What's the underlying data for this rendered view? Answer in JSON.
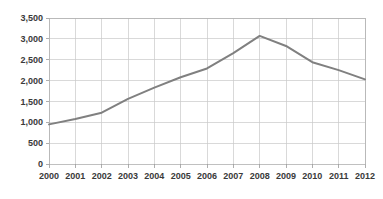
{
  "chart_data": {
    "type": "line",
    "title": "",
    "subtitle": "",
    "xlabel": "",
    "ylabel": "",
    "categories": [
      "2000",
      "2001",
      "2002",
      "2003",
      "2004",
      "2005",
      "2006",
      "2007",
      "2008",
      "2009",
      "2010",
      "2011",
      "2012"
    ],
    "values": [
      950,
      1080,
      1230,
      1560,
      1830,
      2080,
      2290,
      2660,
      3070,
      2830,
      2440,
      2250,
      2030
    ],
    "series": [
      {
        "name": "",
        "color": "#808080",
        "values": [
          950,
          1080,
          1230,
          1560,
          1830,
          2080,
          2290,
          2660,
          3070,
          2830,
          2440,
          2250,
          2030
        ]
      }
    ],
    "ylim": [
      0,
      3500
    ],
    "ytick_values": [
      0,
      500,
      1000,
      1500,
      2000,
      2500,
      3000,
      3500
    ],
    "ytick_labels": [
      "0",
      "500",
      "1,000",
      "1,500",
      "2,000",
      "2,500",
      "3,000",
      "3,500"
    ],
    "xtick_labels": [
      "2000",
      "2001",
      "2002",
      "2003",
      "2004",
      "2005",
      "2006",
      "2007",
      "2008",
      "2009",
      "2010",
      "2011",
      "2012"
    ],
    "grid": {
      "horizontal": true,
      "vertical": true,
      "color": "#c9c9c9"
    },
    "legend": {
      "visible": false,
      "position": "none",
      "entries": []
    },
    "markers": false,
    "background_color": "#ffffff",
    "line_color": "#808080",
    "axis_color": "#b0b0b0",
    "tick_label_color": "#3a3a3a"
  }
}
